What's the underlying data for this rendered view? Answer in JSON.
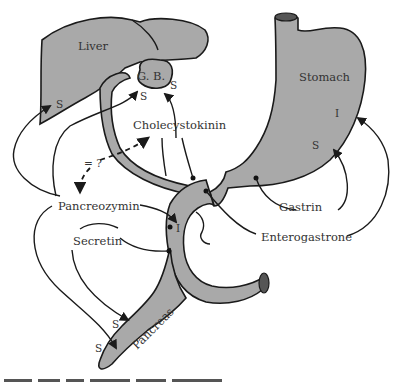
{
  "diagram": {
    "organs": {
      "liver": "Liver",
      "gallbladder": "G. B.",
      "stomach": "Stomach",
      "pancreas": "Pancreas"
    },
    "hormones": {
      "cholecystokinin": "Cholecystokinin",
      "pancreozymin": "Pancreozymin",
      "secretin": "Secretin",
      "gastrin": "Gastrin",
      "enterogastrone": "Enterogastrone"
    },
    "markers": {
      "liver_s": "S",
      "gb_s1": "S",
      "gb_s2": "S",
      "stomach_i": "I",
      "stomach_s": "S",
      "duodenum_i": "I",
      "pancreas_s1": "S",
      "pancreas_s2": "S"
    },
    "relation": "= ?",
    "colors": {
      "organ_fill": "#a9a9a9",
      "outline": "#1a1a1a",
      "text": "#333333"
    }
  }
}
